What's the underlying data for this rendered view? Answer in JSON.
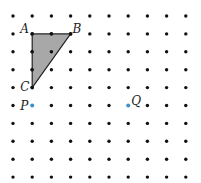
{
  "diagram": {
    "grid": {
      "columns": 10,
      "rows": 10,
      "x0": 13,
      "y0": 16,
      "dx": 19.2,
      "dy": 17.9,
      "dot_color": "#111111"
    },
    "triangle": {
      "fill": "#a8a8a8",
      "stroke": "#222222",
      "vertices": [
        "A",
        "B",
        "C"
      ]
    },
    "points": {
      "A": {
        "label": "A",
        "col": 1,
        "row": 1
      },
      "B": {
        "label": "B",
        "col": 3,
        "row": 1
      },
      "C": {
        "label": "C",
        "col": 1,
        "row": 4
      },
      "P": {
        "label": "P",
        "col": 1,
        "row": 5,
        "color": "#3a8fd0"
      },
      "Q": {
        "label": "Q",
        "col": 6,
        "row": 5,
        "color": "#3a8fd0"
      }
    }
  }
}
